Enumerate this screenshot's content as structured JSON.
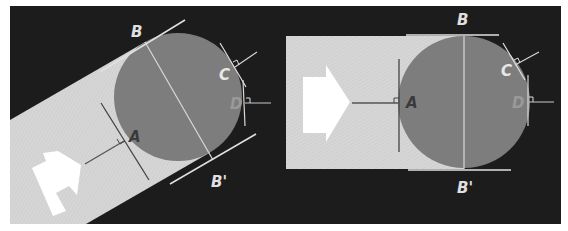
{
  "figure": {
    "background_color": "#1c1c1c",
    "band_color": "#d4d4d4",
    "circle_color": "#7d7d7d",
    "arrow_color": "#ffffff",
    "line_dark": "#555555",
    "line_light": "#e6e6e6"
  },
  "left_panel": {
    "description": "Rotated band flowing into circle (tilted view)",
    "labels": {
      "B": "B",
      "B_prime": "B'",
      "A": "A",
      "C": "C",
      "D": "D"
    }
  },
  "right_panel": {
    "description": "Horizontal band flowing into circle (axis-aligned view)",
    "labels": {
      "B": "B",
      "B_prime": "B'",
      "A": "A",
      "C": "C",
      "D": "D"
    }
  }
}
